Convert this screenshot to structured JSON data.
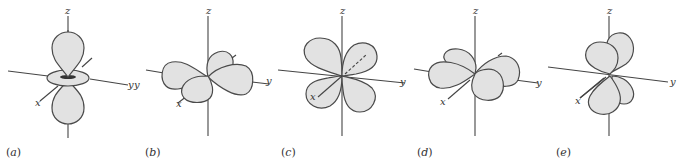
{
  "figure": {
    "fill_color": "#e2e2e2",
    "outline_color": "#4a4a4a",
    "axis_labels": {
      "x": "x",
      "y": "y",
      "z": "z"
    },
    "panels": [
      {
        "id": "a",
        "label": "(a)",
        "letter": "a",
        "orbital": "dz2"
      },
      {
        "id": "b",
        "label": "(b)",
        "letter": "b",
        "orbital": "dx2-y2"
      },
      {
        "id": "c",
        "label": "(c)",
        "letter": "c",
        "orbital": "dyz"
      },
      {
        "id": "d",
        "label": "(d)",
        "letter": "d",
        "orbital": "dxy"
      },
      {
        "id": "e",
        "label": "(e)",
        "letter": "e",
        "orbital": "dxz"
      }
    ]
  }
}
